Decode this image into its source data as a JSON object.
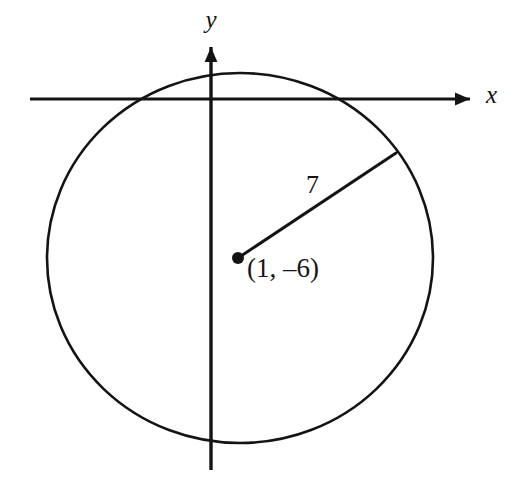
{
  "figure": {
    "kind": "coordinate-plane-circle-diagram",
    "background_color": "#ffffff",
    "ink_color": "#141414",
    "width": 516,
    "height": 488,
    "axes": {
      "x_axis_label": "x",
      "y_axis_label": "y",
      "x_axis_y_pixel": 99,
      "x_axis_start_x": 30,
      "x_axis_end_x": 477,
      "y_axis_x_pixel": 211,
      "y_axis_start_y": 40,
      "y_axis_end_y": 470,
      "arrowheads": [
        "x-positive",
        "y-positive"
      ]
    },
    "circle": {
      "center_label": "(1, –6)",
      "center_x_pixel": 240,
      "center_y_pixel": 258,
      "radius_x_pixel": 193,
      "radius_y_pixel": 185,
      "stroke_width": 2.6
    },
    "center_point": {
      "label": "center-dot",
      "x_pixel": 238,
      "y_pixel": 258,
      "dot_radius": 6
    },
    "radius_segment": {
      "label": "7",
      "from_x_pixel": 238,
      "from_y_pixel": 258,
      "to_x_pixel": 396,
      "to_y_pixel": 153,
      "stroke_width": 3
    },
    "labels": {
      "y_label": {
        "text": "y",
        "x": 211,
        "y": 28
      },
      "x_label": {
        "text": "x",
        "x": 486,
        "y": 103
      },
      "radius_label": {
        "text": "7",
        "x": 306,
        "y": 193
      },
      "center_point_label": {
        "text": "(1, –6)",
        "x": 247,
        "y": 277
      }
    }
  }
}
